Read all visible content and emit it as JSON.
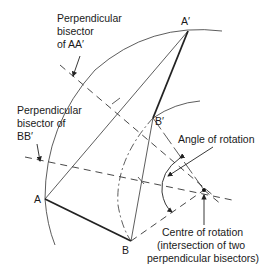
{
  "points": {
    "A": "A",
    "A_prime": "A′",
    "B": "B",
    "B_prime": "B′"
  },
  "labels": {
    "bisector_aa": [
      "Perpendicular",
      "bisector",
      "of AA′"
    ],
    "bisector_bb": [
      "Perpendicular",
      "bisector of",
      "BB′"
    ],
    "angle": "Angle of rotation",
    "centre": [
      "Centre of rotation",
      "(intersection of two",
      "perpendicular bisectors)"
    ]
  },
  "colors": {
    "ink": "#222222",
    "background": "#ffffff"
  }
}
